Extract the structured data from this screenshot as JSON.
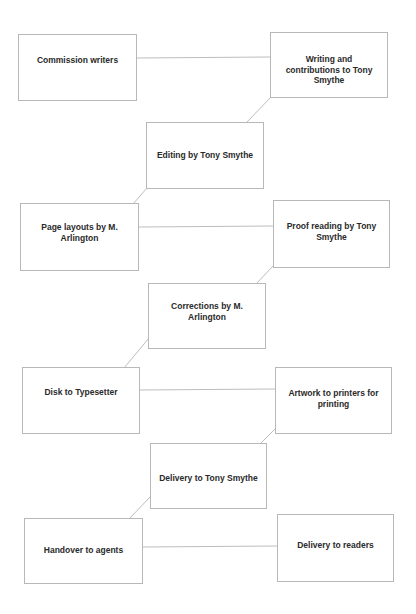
{
  "diagram": {
    "type": "flowchart",
    "nodes": [
      {
        "id": "n1",
        "label": "Commission writers",
        "x": 18,
        "y": 34,
        "w": 119,
        "h": 67,
        "text_top": 20
      },
      {
        "id": "n2",
        "label": "Writing and contributions to Tony Smythe",
        "x": 270,
        "y": 32,
        "w": 118,
        "h": 66,
        "text_top": 21
      },
      {
        "id": "n3",
        "label": "Editing by Tony Smythe",
        "x": 146,
        "y": 122,
        "w": 118,
        "h": 67,
        "text_top": 27
      },
      {
        "id": "n4",
        "label": "Page layouts by M. Arlington",
        "x": 20,
        "y": 203,
        "w": 119,
        "h": 68,
        "text_top": 18
      },
      {
        "id": "n5",
        "label": "Proof reading by Tony Smythe",
        "x": 273,
        "y": 200,
        "w": 117,
        "h": 68,
        "text_top": 20
      },
      {
        "id": "n6",
        "label": "Corrections by M. Arlington",
        "x": 148,
        "y": 283,
        "w": 118,
        "h": 66,
        "text_top": 17
      },
      {
        "id": "n7",
        "label": "Disk to Typesetter",
        "x": 22,
        "y": 367,
        "w": 118,
        "h": 67,
        "text_top": 19
      },
      {
        "id": "n8",
        "label": "Artwork to printers for printing",
        "x": 275,
        "y": 367,
        "w": 117,
        "h": 67,
        "text_top": 20
      },
      {
        "id": "n9",
        "label": "Delivery to Tony Smythe",
        "x": 150,
        "y": 443,
        "w": 117,
        "h": 66,
        "text_top": 29
      },
      {
        "id": "n10",
        "label": "Handover to agents",
        "x": 24,
        "y": 518,
        "w": 119,
        "h": 66,
        "text_top": 26
      },
      {
        "id": "n11",
        "label": "Delivery to readers",
        "x": 277,
        "y": 514,
        "w": 117,
        "h": 68,
        "text_top": 25
      }
    ],
    "edges": [
      {
        "from": "n1",
        "to": "n2",
        "x1": 137,
        "y1": 58,
        "x2": 270,
        "y2": 57
      },
      {
        "from": "n2",
        "to": "n3",
        "x1": 271,
        "y1": 97,
        "x2": 247,
        "y2": 122
      },
      {
        "from": "n3",
        "to": "n4",
        "x1": 147,
        "y1": 188,
        "x2": 133,
        "y2": 204
      },
      {
        "from": "n4",
        "to": "n5",
        "x1": 139,
        "y1": 227,
        "x2": 274,
        "y2": 226
      },
      {
        "from": "n5",
        "to": "n6",
        "x1": 274,
        "y1": 265,
        "x2": 256,
        "y2": 284
      },
      {
        "from": "n6",
        "to": "n7",
        "x1": 149,
        "y1": 338,
        "x2": 124,
        "y2": 368
      },
      {
        "from": "n7",
        "to": "n8",
        "x1": 140,
        "y1": 390,
        "x2": 276,
        "y2": 389
      },
      {
        "from": "n8",
        "to": "n9",
        "x1": 276,
        "y1": 428,
        "x2": 261,
        "y2": 443
      },
      {
        "from": "n9",
        "to": "n10",
        "x1": 151,
        "y1": 496,
        "x2": 130,
        "y2": 518
      },
      {
        "from": "n10",
        "to": "n11",
        "x1": 143,
        "y1": 547,
        "x2": 278,
        "y2": 546
      }
    ],
    "colors": {
      "border": "#b8b8b8",
      "edge": "#bdbdbd",
      "text": "#2a2a2a",
      "background": "#ffffff"
    }
  }
}
